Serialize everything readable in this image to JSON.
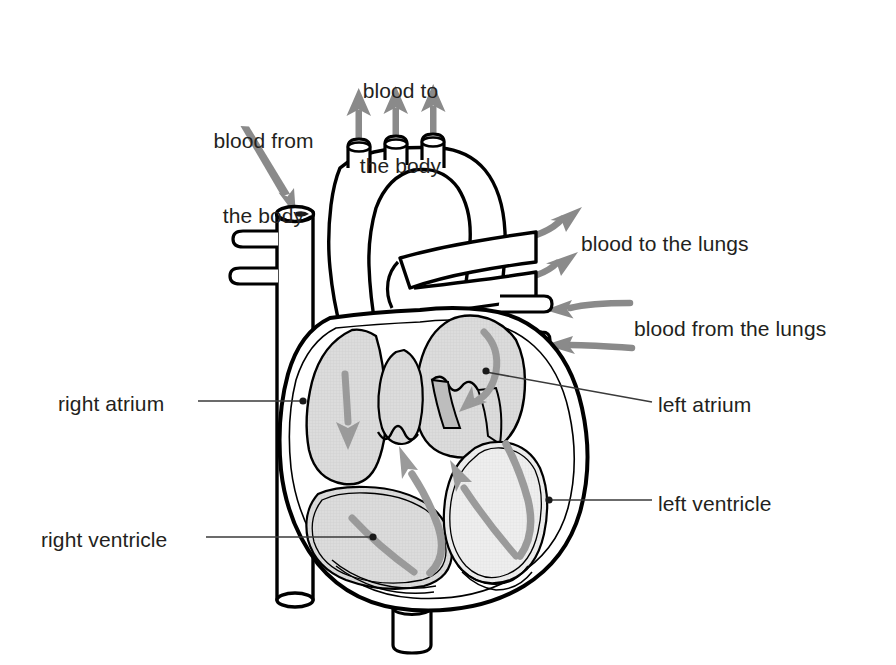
{
  "colors": {
    "text": "#231f20",
    "outline": "#000000",
    "arrow_grey": "#8a8a8a",
    "flow_arrow_grey": "#9a9a9a",
    "chamber_fill": "#d9d9d9",
    "chamber_fill_light": "#ececec",
    "muscle_fill": "#ffffff",
    "leader_line": "#3a3a3a",
    "background": "#ffffff"
  },
  "labels": {
    "blood_from_body": {
      "text": "blood from\nthe body",
      "line1": "blood from",
      "line2": "the body",
      "x": 196,
      "y": 78,
      "align": "center",
      "width": 135
    },
    "blood_to_body": {
      "text": "blood to\nthe body",
      "line1": "blood to",
      "line2": "the body",
      "x": 343,
      "y": 28,
      "align": "center",
      "width": 115
    },
    "blood_to_lungs": {
      "text": "blood to the lungs",
      "x": 581,
      "y": 231,
      "align": "left",
      "width": 220
    },
    "blood_from_lungs": {
      "text": "blood from the lungs",
      "x": 634,
      "y": 316,
      "align": "left",
      "width": 250
    },
    "right_atrium": {
      "text": "right atrium",
      "x": 58,
      "y": 391,
      "align": "left",
      "width": 140
    },
    "right_ventricle": {
      "text": "right ventricle",
      "x": 41,
      "y": 527,
      "align": "left",
      "width": 165
    },
    "left_atrium": {
      "text": "left atrium",
      "x": 658,
      "y": 392,
      "align": "left",
      "width": 130
    },
    "left_ventricle": {
      "text": "left ventricle",
      "x": 658,
      "y": 491,
      "align": "left",
      "width": 150
    }
  },
  "icons": {
    "arrow_up": "arrow-up-icon",
    "arrow_down": "arrow-down-icon",
    "arrow_right": "arrow-right-icon",
    "arrow_left": "arrow-left-icon",
    "flow_curve": "curved-flow-arrow-icon"
  },
  "flow_arrows": [
    {
      "name": "aorta-branch-1-out",
      "direction": "up",
      "meaning": "blood to the body"
    },
    {
      "name": "aorta-branch-2-out",
      "direction": "up",
      "meaning": "blood to the body"
    },
    {
      "name": "aorta-branch-3-out",
      "direction": "up",
      "meaning": "blood to the body"
    },
    {
      "name": "vena-cava-in",
      "direction": "down",
      "meaning": "blood from the body"
    },
    {
      "name": "pulmonary-artery-out-upper",
      "direction": "right",
      "meaning": "blood to the lungs"
    },
    {
      "name": "pulmonary-artery-out-lower",
      "direction": "right",
      "meaning": "blood to the lungs"
    },
    {
      "name": "pulmonary-vein-in-upper",
      "direction": "left",
      "meaning": "blood from the lungs"
    },
    {
      "name": "pulmonary-vein-in-lower",
      "direction": "left",
      "meaning": "blood from the lungs"
    },
    {
      "name": "right-atrium-flow",
      "direction": "down",
      "meaning": "flow through right atrium"
    },
    {
      "name": "right-ventricle-flow",
      "direction": "up",
      "meaning": "flow out of right ventricle"
    },
    {
      "name": "left-atrium-flow",
      "direction": "down-curved",
      "meaning": "flow through left atrium"
    },
    {
      "name": "left-ventricle-flow",
      "direction": "up",
      "meaning": "flow out of left ventricle"
    }
  ]
}
